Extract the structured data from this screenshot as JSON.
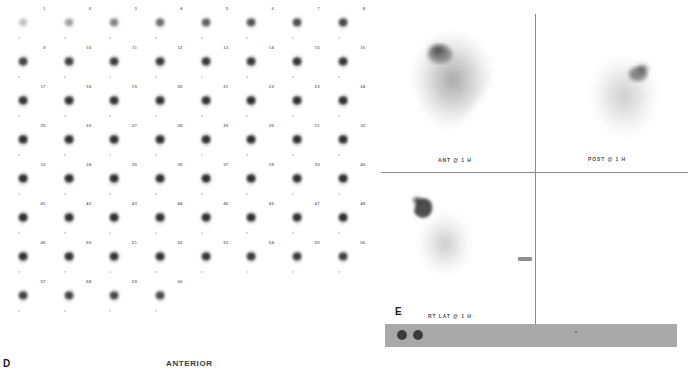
{
  "study": {
    "header_text": "ANTERIOR IMAGES (1-5)",
    "modality": "scintigraphy"
  },
  "panel_d": {
    "letter": "D",
    "orientation_label": "ANTERIOR",
    "columns": 8,
    "total_frames": 60,
    "frame_numbers": [
      1,
      2,
      3,
      4,
      5,
      6,
      7,
      8,
      9,
      10,
      11,
      12,
      13,
      14,
      15,
      16,
      17,
      18,
      19,
      20,
      21,
      22,
      23,
      24,
      25,
      26,
      27,
      28,
      29,
      30,
      31,
      32,
      33,
      34,
      35,
      36,
      37,
      38,
      39,
      40,
      41,
      42,
      43,
      44,
      45,
      46,
      47,
      48,
      49,
      50,
      51,
      52,
      53,
      54,
      55,
      56,
      57,
      58,
      59,
      60
    ],
    "frame_intensity": [
      0.18,
      0.3,
      0.42,
      0.52,
      0.6,
      0.66,
      0.7,
      0.74,
      0.78,
      0.8,
      0.82,
      0.84,
      0.85,
      0.86,
      0.87,
      0.88,
      0.89,
      0.9,
      0.9,
      0.91,
      0.91,
      0.92,
      0.92,
      0.92,
      0.93,
      0.93,
      0.93,
      0.93,
      0.94,
      0.94,
      0.94,
      0.94,
      0.94,
      0.94,
      0.94,
      0.94,
      0.94,
      0.94,
      0.94,
      0.94,
      0.93,
      0.93,
      0.93,
      0.93,
      0.93,
      0.93,
      0.92,
      0.92,
      0.9,
      0.9,
      0.89,
      0.88,
      0.86,
      0.84,
      0.82,
      0.8,
      0.78,
      0.76,
      0.74,
      0.72
    ]
  },
  "panel_e": {
    "letter": "E",
    "views": [
      {
        "name": "anterior-view",
        "label": "ANT @ 1 H"
      },
      {
        "name": "posterior-view",
        "label": "POST @ 1 H"
      },
      {
        "name": "right-lateral-view",
        "label": "RT LAT @ 1 H"
      }
    ],
    "scale_bar": {
      "marker_count": 2
    }
  },
  "colors": {
    "background": "#ffffff",
    "crosshair_line": "#888888",
    "label_text": "#4d4d4d",
    "panel_letter": "#1a1a1a",
    "scale_bar_gray": "#a9a9a9",
    "scale_marker": "#3c3c3c",
    "uptake_dark": "#2a2a2a"
  }
}
